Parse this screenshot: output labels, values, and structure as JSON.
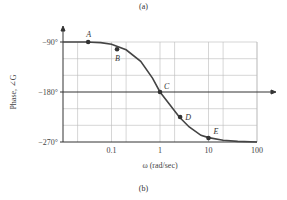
{
  "captions": {
    "top": "(a)",
    "bottom": "(b)"
  },
  "chart_data": {
    "type": "line",
    "title": "",
    "xlabel": "ω (rad/sec)",
    "ylabel": "Phase, ∠G",
    "xscale": "log",
    "xlim": [
      0.01,
      100
    ],
    "ylim": [
      -270,
      -90
    ],
    "x_ticks": [
      "0.1",
      "1",
      "10",
      "100"
    ],
    "y_ticks": [
      "−90°",
      "−180°",
      "−270°"
    ],
    "grid": true,
    "series": [
      {
        "name": "Phase",
        "x": [
          0.01,
          0.03,
          0.06,
          0.1,
          0.2,
          0.4,
          0.7,
          1,
          1.5,
          2.5,
          4,
          7,
          10,
          20,
          40,
          100
        ],
        "y": [
          -90,
          -90,
          -91,
          -94,
          -104,
          -125,
          -155,
          -180,
          -200,
          -225,
          -243,
          -258,
          -262,
          -267,
          -269,
          -270
        ]
      }
    ],
    "annotations": [
      {
        "label": "A",
        "x": 0.033,
        "y": -90
      },
      {
        "label": "B",
        "x": 0.13,
        "y": -103
      },
      {
        "label": "C",
        "x": 1,
        "y": -180
      },
      {
        "label": "D",
        "x": 2.6,
        "y": -225
      },
      {
        "label": "E",
        "x": 10,
        "y": -263
      }
    ]
  }
}
